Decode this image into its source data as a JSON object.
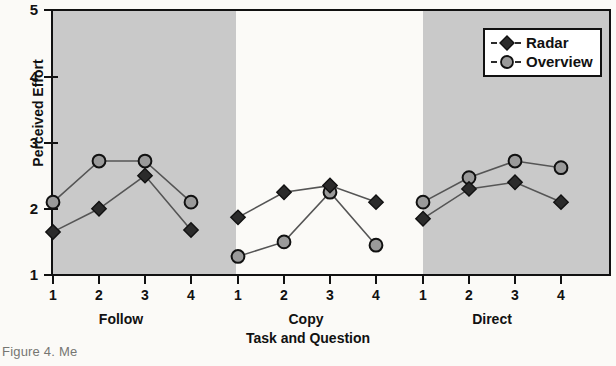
{
  "chart_data": {
    "type": "line",
    "title": "",
    "xlabel": "Task and Question",
    "ylabel": "Perceived Effort",
    "ylim": [
      1,
      5
    ],
    "yticks": [
      "1",
      "2",
      "3",
      "4",
      "5"
    ],
    "grid": false,
    "legend_position": "top-right",
    "groups": [
      {
        "name": "Follow",
        "shaded": true,
        "questions": [
          "1",
          "2",
          "3",
          "4"
        ]
      },
      {
        "name": "Copy",
        "shaded": false,
        "questions": [
          "1",
          "2",
          "3",
          "4"
        ]
      },
      {
        "name": "Direct",
        "shaded": true,
        "questions": [
          "1",
          "2",
          "3",
          "4"
        ]
      }
    ],
    "categories": [
      "Follow 1",
      "Follow 2",
      "Follow 3",
      "Follow 4",
      "Copy 1",
      "Copy 2",
      "Copy 3",
      "Copy 4",
      "Direct 1",
      "Direct 2",
      "Direct 3",
      "Direct 4"
    ],
    "series": [
      {
        "name": "Radar",
        "marker": "filled-diamond",
        "color": "#2b2b2b",
        "values": [
          1.65,
          2.0,
          2.5,
          1.68,
          1.87,
          2.25,
          2.35,
          2.1,
          1.85,
          2.3,
          2.4,
          2.1
        ]
      },
      {
        "name": "Overview",
        "marker": "open-circle",
        "color": "#9a9a9a",
        "values": [
          2.1,
          2.72,
          2.72,
          2.1,
          1.28,
          1.5,
          2.25,
          1.45,
          2.1,
          2.47,
          2.72,
          2.62
        ]
      }
    ]
  },
  "axes": {
    "y_title": "Perceived Effort",
    "x_title": "Task and Question",
    "y_tick_labels": [
      "5",
      "4",
      "3",
      "2",
      "1"
    ],
    "x_tick_labels": [
      "1",
      "2",
      "3",
      "4",
      "1",
      "2",
      "3",
      "4",
      "1",
      "2",
      "3",
      "4"
    ]
  },
  "legend": {
    "entries": [
      {
        "label": "Radar",
        "marker": "filled-diamond"
      },
      {
        "label": "Overview",
        "marker": "open-circle"
      }
    ]
  },
  "caption": "Figure 4. Me"
}
